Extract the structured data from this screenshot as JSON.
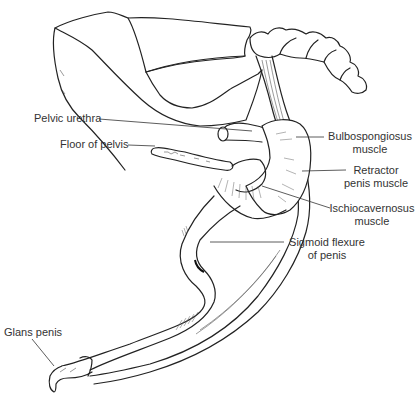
{
  "figure": {
    "labels": {
      "pelvic_urethra": "Pelvic urethra",
      "floor_of_pelvis": "Floor of pelvis",
      "bulbospongiosus_line1": "Bulbospongiosus",
      "bulbospongiosus_line2": "muscle",
      "retractor_line1": "Retractor",
      "retractor_line2": "penis muscle",
      "ischio_line1": "Ischiocavernosus",
      "ischio_line2": "muscle",
      "sigmoid_line1": "Sigmoid flexure",
      "sigmoid_line2": "of penis",
      "glans_penis": "Glans penis"
    },
    "colors": {
      "line": "#222222",
      "text": "#333333",
      "background": "#ffffff"
    }
  }
}
